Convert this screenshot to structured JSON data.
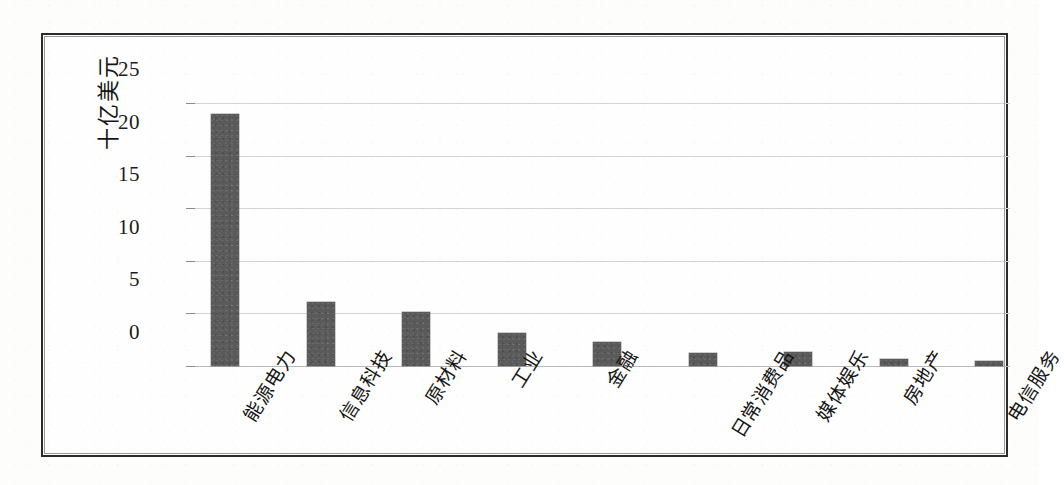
{
  "figure": {
    "frame_color": "#2b2b2b",
    "background_color": "#fefefe"
  },
  "chart_data": {
    "type": "bar",
    "title": "",
    "xlabel": "",
    "ylabel": "十亿美元",
    "ylim": [
      0,
      25
    ],
    "yticks": [
      0,
      5,
      10,
      15,
      20,
      25
    ],
    "ytick_labels": [
      "0",
      "5",
      "10",
      "15",
      "20",
      "25"
    ],
    "grid": true,
    "legend": false,
    "bar_color": "#5a5a5a",
    "categories": [
      "能源电力",
      "信息科技",
      "原材料",
      "工业",
      "金融",
      "日常消费品",
      "媒体娱乐",
      "房地产",
      "电信服务"
    ],
    "values": [
      24.0,
      6.1,
      5.1,
      3.1,
      2.3,
      1.2,
      1.3,
      0.7,
      0.5
    ],
    "series": [
      {
        "name": "",
        "values": [
          24.0,
          6.1,
          5.1,
          3.1,
          2.3,
          1.2,
          1.3,
          0.7,
          0.5
        ]
      }
    ]
  }
}
